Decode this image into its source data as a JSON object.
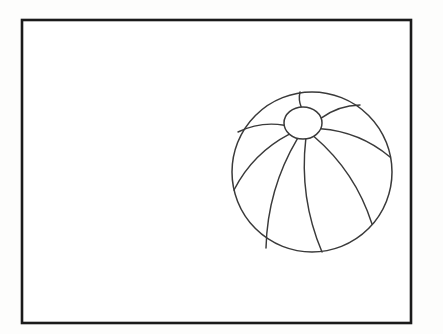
{
  "document": {
    "title": "Beach Ball Line Drawing",
    "kind": "coloring-page-illustration",
    "caption": ""
  },
  "canvas": {
    "width": 443,
    "height": 334,
    "background_color": "#fdfdfc"
  },
  "frame": {
    "name": "border-rectangle",
    "x": 22,
    "y": 20,
    "width": 389,
    "height": 303,
    "stroke_color": "#1a1a1a",
    "stroke_width": 2.6,
    "fill_color": "#ffffff"
  },
  "ball": {
    "name": "beach-ball",
    "center_x": 312,
    "center_y": 172,
    "radius": 80,
    "stroke_color": "#3a3a3a",
    "stroke_width": 1.5,
    "fill_color": "#ffffff",
    "panel_count": 8,
    "cap": {
      "name": "ball-cap",
      "center_x": 303,
      "center_y": 123,
      "radius_x": 19,
      "radius_y": 16
    },
    "seams": [
      {
        "id": "seam-1",
        "label": "top",
        "end_x": 300,
        "end_y": 92
      },
      {
        "id": "seam-2",
        "label": "upper-right",
        "end_x": 360,
        "end_y": 105
      },
      {
        "id": "seam-3",
        "label": "right",
        "end_x": 390,
        "end_y": 157
      },
      {
        "id": "seam-4",
        "label": "lower-right",
        "end_x": 372,
        "end_y": 224
      },
      {
        "id": "seam-5",
        "label": "bottom-right",
        "end_x": 322,
        "end_y": 252
      },
      {
        "id": "seam-6",
        "label": "bottom-left",
        "end_x": 266,
        "end_y": 248
      },
      {
        "id": "seam-7",
        "label": "left",
        "end_x": 234,
        "end_y": 190
      },
      {
        "id": "seam-8",
        "label": "upper-left",
        "end_x": 238,
        "end_y": 132
      }
    ]
  },
  "palette": {
    "ink": "#1a1a1a",
    "line": "#3a3a3a",
    "paper": "#ffffff",
    "page": "#fdfdfc"
  }
}
